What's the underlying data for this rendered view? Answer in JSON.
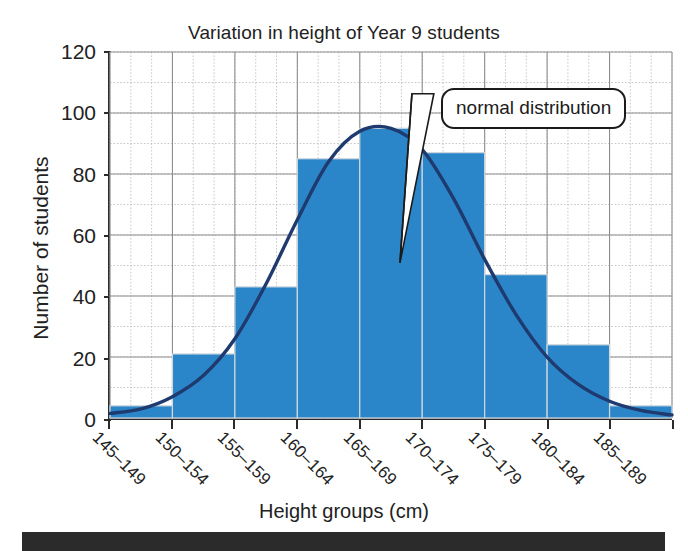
{
  "artifact": {
    "top_fragment": " ",
    "bottom_band": "page-edge-band"
  },
  "chart_data": {
    "type": "bar",
    "title": "Variation in height of Year 9 students",
    "xlabel": "Height groups (cm)",
    "ylabel": "Number of students",
    "categories": [
      "145–149",
      "150–154",
      "155–159",
      "160–164",
      "165–169",
      "170–174",
      "175–179",
      "180–184",
      "185–189"
    ],
    "values": [
      4,
      21,
      43,
      85,
      95,
      87,
      47,
      24,
      4
    ],
    "ylim": [
      0,
      120
    ],
    "ytick_values": [
      0,
      20,
      40,
      60,
      80,
      100,
      120
    ],
    "ytick_labels": [
      "0",
      "20",
      "40",
      "60",
      "80",
      "100",
      "120"
    ],
    "grid": "major and minor dotted",
    "legend": "none",
    "annotations": [
      {
        "text": "normal distribution",
        "type": "callout",
        "points_to": "normal distribution curve"
      }
    ],
    "series": [
      {
        "name": "Number of students",
        "type": "bar",
        "values": [
          4,
          21,
          43,
          85,
          95,
          87,
          47,
          24,
          4
        ],
        "color": "#2b86c9"
      },
      {
        "name": "normal distribution",
        "type": "line",
        "color": "#1f3a6e",
        "curve_points": [
          [
            0.0,
            1.5
          ],
          [
            0.5,
            3.0
          ],
          [
            1.0,
            7.0
          ],
          [
            1.5,
            14.0
          ],
          [
            2.0,
            26.0
          ],
          [
            2.5,
            44.0
          ],
          [
            3.0,
            65.0
          ],
          [
            3.5,
            84.0
          ],
          [
            4.0,
            94.0
          ],
          [
            4.5,
            95.0
          ],
          [
            5.0,
            88.0
          ],
          [
            5.5,
            72.0
          ],
          [
            6.0,
            52.0
          ],
          [
            6.5,
            34.0
          ],
          [
            7.0,
            20.0
          ],
          [
            7.5,
            11.0
          ],
          [
            8.0,
            5.5
          ],
          [
            8.5,
            2.5
          ],
          [
            9.0,
            1.0
          ]
        ]
      }
    ]
  }
}
